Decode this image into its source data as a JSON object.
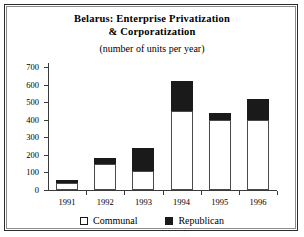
{
  "chart_data": {
    "type": "bar",
    "stacked": true,
    "title": "Belarus: Enterprise Privatization & Corporatization",
    "title_line1": "Belarus: Enterprise Privatization",
    "title_line2": "& Corporatization",
    "subtitle": "(number of units per year)",
    "xlabel": "",
    "ylabel": "",
    "ylim": [
      0,
      700
    ],
    "yticks": [
      0,
      100,
      200,
      300,
      400,
      500,
      600,
      700
    ],
    "grid": false,
    "legend_position": "bottom",
    "categories": [
      "1991",
      "1992",
      "1993",
      "1994",
      "1995",
      "1996"
    ],
    "series": [
      {
        "name": "Communal",
        "color": "#ffffff",
        "values": [
          40,
          150,
          110,
          450,
          400,
          400
        ]
      },
      {
        "name": "Republican",
        "color": "#1a1a1a",
        "values": [
          15,
          30,
          130,
          170,
          40,
          120
        ]
      }
    ],
    "totals": [
      55,
      180,
      240,
      620,
      440,
      520
    ]
  }
}
